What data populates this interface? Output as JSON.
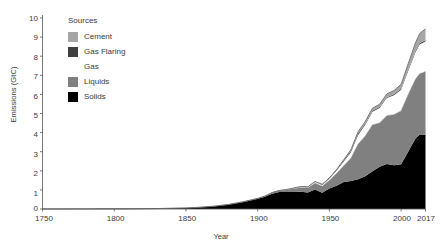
{
  "chart_data": {
    "type": "area",
    "stacked": true,
    "title": "",
    "xlabel": "Year",
    "ylabel": "Emissions (GtC)",
    "xlim": [
      1750,
      2017
    ],
    "ylim": [
      0,
      10
    ],
    "xticks": [
      1750,
      1800,
      1850,
      1900,
      1950,
      2000,
      2017
    ],
    "yticks": [
      0,
      1,
      2,
      3,
      4,
      5,
      6,
      7,
      8,
      9,
      10
    ],
    "grid": false,
    "legend_title": "Sources",
    "legend_position": "upper-left-inside",
    "colors": {
      "cement": "#a6a6a6",
      "gas_flaring": "#404040",
      "gas": "#ffffff",
      "liquids": "#808080",
      "solids": "#000000",
      "axis": "#555555",
      "text": "#3a3a3a",
      "background": "#ffffff",
      "outline": "#6e6e6e"
    },
    "legend_order_top_to_bottom": [
      "Cement",
      "Gas Flaring",
      "Gas",
      "Liquids",
      "Solids"
    ],
    "stack_order_bottom_to_top": [
      "Solids",
      "Liquids",
      "Gas",
      "Gas Flaring",
      "Cement"
    ],
    "x": [
      1750,
      1760,
      1770,
      1780,
      1790,
      1800,
      1810,
      1820,
      1830,
      1840,
      1850,
      1860,
      1870,
      1880,
      1890,
      1900,
      1905,
      1910,
      1915,
      1920,
      1925,
      1930,
      1935,
      1940,
      1945,
      1950,
      1955,
      1960,
      1965,
      1970,
      1975,
      1980,
      1985,
      1990,
      1995,
      2000,
      2005,
      2010,
      2013,
      2015,
      2017
    ],
    "series": [
      {
        "name": "Solids",
        "color": "#000000",
        "values": [
          0.003,
          0.003,
          0.004,
          0.005,
          0.007,
          0.008,
          0.011,
          0.017,
          0.024,
          0.037,
          0.054,
          0.091,
          0.147,
          0.236,
          0.368,
          0.531,
          0.64,
          0.8,
          0.884,
          0.885,
          0.896,
          0.897,
          0.86,
          1.023,
          0.845,
          1.07,
          1.213,
          1.41,
          1.468,
          1.556,
          1.712,
          1.977,
          2.209,
          2.35,
          2.296,
          2.337,
          3.01,
          3.69,
          3.9,
          3.88,
          3.9
        ]
      },
      {
        "name": "Liquids",
        "color": "#808080",
        "values": [
          0,
          0,
          0,
          0,
          0,
          0,
          0,
          0,
          0,
          0,
          0,
          0,
          0.001,
          0.004,
          0.01,
          0.019,
          0.028,
          0.048,
          0.072,
          0.108,
          0.16,
          0.221,
          0.238,
          0.322,
          0.341,
          0.423,
          0.64,
          0.849,
          1.184,
          1.838,
          2.105,
          2.423,
          2.293,
          2.53,
          2.64,
          2.8,
          2.99,
          3.1,
          3.18,
          3.25,
          3.3
        ]
      },
      {
        "name": "Gas",
        "color": "#ffffff",
        "values": [
          0,
          0,
          0,
          0,
          0,
          0,
          0,
          0,
          0,
          0,
          0,
          0,
          0,
          0,
          0.001,
          0.002,
          0.004,
          0.009,
          0.013,
          0.018,
          0.027,
          0.037,
          0.042,
          0.063,
          0.077,
          0.097,
          0.15,
          0.227,
          0.32,
          0.484,
          0.588,
          0.69,
          0.79,
          0.93,
          1.02,
          1.11,
          1.24,
          1.42,
          1.54,
          1.56,
          1.58
        ]
      },
      {
        "name": "Gas Flaring",
        "color": "#404040",
        "values": [
          0,
          0,
          0,
          0,
          0,
          0,
          0,
          0,
          0,
          0,
          0,
          0,
          0,
          0,
          0,
          0,
          0,
          0,
          0,
          0.002,
          0.004,
          0.008,
          0.01,
          0.014,
          0.019,
          0.023,
          0.033,
          0.049,
          0.071,
          0.075,
          0.061,
          0.053,
          0.042,
          0.04,
          0.046,
          0.053,
          0.06,
          0.064,
          0.065,
          0.066,
          0.066
        ]
      },
      {
        "name": "Cement",
        "color": "#a6a6a6",
        "values": [
          0,
          0,
          0,
          0,
          0,
          0,
          0,
          0,
          0,
          0,
          0,
          0,
          0,
          0,
          0.001,
          0.002,
          0.003,
          0.005,
          0.005,
          0.007,
          0.012,
          0.018,
          0.016,
          0.021,
          0.013,
          0.018,
          0.03,
          0.043,
          0.061,
          0.095,
          0.116,
          0.131,
          0.149,
          0.172,
          0.2,
          0.226,
          0.32,
          0.43,
          0.51,
          0.56,
          0.58
        ]
      }
    ],
    "totals": [
      0.003,
      0.003,
      0.004,
      0.005,
      0.007,
      0.008,
      0.011,
      0.017,
      0.024,
      0.037,
      0.054,
      0.091,
      0.148,
      0.24,
      0.38,
      0.554,
      0.675,
      0.862,
      0.974,
      1.02,
      1.099,
      1.181,
      1.166,
      1.443,
      1.295,
      1.631,
      2.066,
      2.578,
      3.104,
      4.048,
      4.582,
      5.274,
      5.483,
      6.022,
      6.202,
      6.526,
      7.62,
      8.704,
      9.195,
      9.316,
      9.426
    ]
  },
  "axes": {
    "ylabel": "Emissions (GtC)",
    "xlabel": "Year",
    "yticks": [
      "0",
      "1",
      "2",
      "3",
      "4",
      "5",
      "6",
      "7",
      "8",
      "9",
      "10"
    ],
    "xticks": [
      "1750",
      "1800",
      "1850",
      "1900",
      "1950",
      "2000",
      "2017"
    ]
  },
  "legend": {
    "title": "Sources",
    "items": [
      {
        "label": "Cement",
        "color": "#a6a6a6"
      },
      {
        "label": "Gas Flaring",
        "color": "#404040"
      },
      {
        "label": "Gas",
        "color": "#ffffff"
      },
      {
        "label": "Liquids",
        "color": "#808080"
      },
      {
        "label": "Solids",
        "color": "#000000"
      }
    ]
  }
}
